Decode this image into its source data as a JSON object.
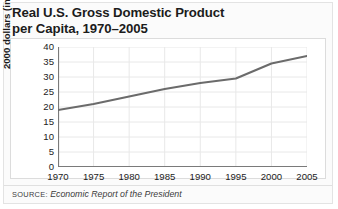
{
  "figure": {
    "title_line1": "Real U.S. Gross Domestic Product",
    "title_line2": "per Capita, 1970–2005",
    "source_label": "SOURCE:",
    "source_name": "Economic Report of the President"
  },
  "colors": {
    "line": "#6b6b6b",
    "axis": "#7a7a7a",
    "grid": "#e8e8e8",
    "text": "#1c1c1c",
    "panel_background": "#ffffff",
    "frame_background": "#fbfbfb",
    "frame_border": "#e3e3e3"
  },
  "chart_data": {
    "type": "line",
    "title": "Real U.S. Gross Domestic Product per Capita, 1970–2005",
    "xlabel": "",
    "ylabel": "2000 dollars (in thousands)",
    "x": [
      1970,
      1975,
      1980,
      1985,
      1990,
      1995,
      2000,
      2005
    ],
    "values": [
      19,
      21,
      23.5,
      26,
      28,
      29.5,
      34.5,
      37
    ],
    "xticklabels": [
      "1970",
      "1975",
      "1980",
      "1985",
      "1990",
      "1995",
      "2000",
      "2005"
    ],
    "yticklabels": [
      "0",
      "5",
      "10",
      "15",
      "20",
      "25",
      "30",
      "35",
      "40"
    ],
    "ytickvalues": [
      0,
      5,
      10,
      15,
      20,
      25,
      30,
      35,
      40
    ],
    "xlim": [
      1970,
      2005
    ],
    "ylim": [
      0,
      40
    ],
    "grid": true,
    "legend": null,
    "series": [
      {
        "name": "Real GDP per capita",
        "values": [
          19,
          21,
          23.5,
          26,
          28,
          29.5,
          34.5,
          37
        ]
      }
    ]
  }
}
